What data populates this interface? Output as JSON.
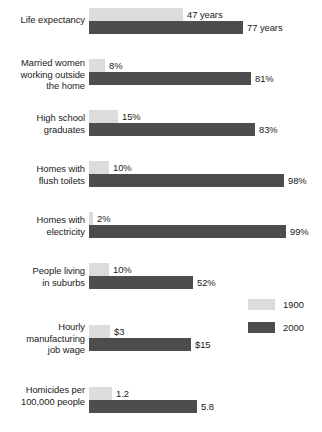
{
  "chart_data": {
    "type": "bar",
    "title": "",
    "subtitle": "",
    "xlabel": "",
    "ylabel": "",
    "orientation": "horizontal",
    "grid": false,
    "legend_position": "right-middle",
    "categories": [
      "Life expectancy",
      "Married women working outside the home",
      "High school graduates",
      "Homes with flush toilets",
      "Homes with electricity",
      "People living in suburbs",
      "Hourly manufacturing job wage",
      "Homicides per 100,000 people"
    ],
    "series": [
      {
        "name": "1900",
        "color": "#dcdcdc",
        "values": [
          47,
          8,
          15,
          10,
          2,
          10,
          3,
          1.2
        ],
        "labels": [
          "47 years",
          "8%",
          "15%",
          "10%",
          "2%",
          "10%",
          "$3",
          "1.2"
        ]
      },
      {
        "name": "2000",
        "color": "#4d4d4d",
        "values": [
          77,
          81,
          83,
          98,
          99,
          52,
          15,
          5.8
        ],
        "labels": [
          "77 years",
          "81%",
          "83%",
          "98%",
          "99%",
          "52%",
          "$15",
          "5.8"
        ]
      }
    ]
  },
  "groups": [
    {
      "label_lines": [
        "Life expectancy"
      ],
      "bar_1900": {
        "label": "47 years",
        "width_px": 94
      },
      "bar_2000": {
        "label": "77 years",
        "width_px": 154
      }
    },
    {
      "label_lines": [
        "Married women",
        "working outside",
        "the home"
      ],
      "bar_1900": {
        "label": "8%",
        "width_px": 16
      },
      "bar_2000": {
        "label": "81%",
        "width_px": 162
      }
    },
    {
      "label_lines": [
        "High school",
        "graduates"
      ],
      "bar_1900": {
        "label": "15%",
        "width_px": 29
      },
      "bar_2000": {
        "label": "83%",
        "width_px": 166
      }
    },
    {
      "label_lines": [
        "Homes with",
        "flush toilets"
      ],
      "bar_1900": {
        "label": "10%",
        "width_px": 20
      },
      "bar_2000": {
        "label": "98%",
        "width_px": 195
      }
    },
    {
      "label_lines": [
        "Homes with",
        "electricity"
      ],
      "bar_1900": {
        "label": "2%",
        "width_px": 4
      },
      "bar_2000": {
        "label": "99%",
        "width_px": 197
      }
    },
    {
      "label_lines": [
        "People living",
        "in suburbs"
      ],
      "bar_1900": {
        "label": "10%",
        "width_px": 20
      },
      "bar_2000": {
        "label": "52%",
        "width_px": 104
      }
    },
    {
      "label_lines": [
        "Hourly",
        "manufacturing",
        "job wage"
      ],
      "bar_1900": {
        "label": "$3",
        "width_px": 21
      },
      "bar_2000": {
        "label": "$15",
        "width_px": 102
      }
    },
    {
      "label_lines": [
        "Homicides per",
        "100,000 people"
      ],
      "bar_1900": {
        "label": "1.2",
        "width_px": 23
      },
      "bar_2000": {
        "label": "5.8",
        "width_px": 108
      }
    }
  ],
  "legend": {
    "entries": [
      {
        "label": "1900",
        "color": "#dcdcdc"
      },
      {
        "label": "2000",
        "color": "#4d4d4d"
      }
    ]
  }
}
